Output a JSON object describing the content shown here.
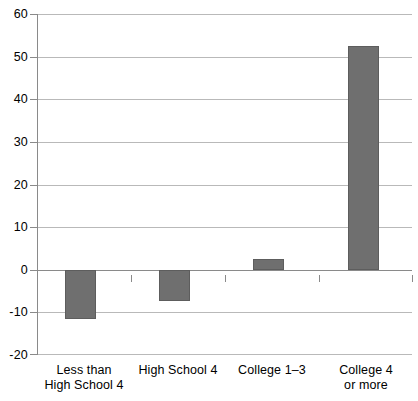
{
  "chart_data": {
    "type": "bar",
    "title": "",
    "subtitle": "",
    "xlabel": "",
    "ylabel": "",
    "categories": [
      "Less than High School 4",
      "High School 4",
      "College 1–3",
      "College 4 or more"
    ],
    "category_lines": [
      [
        "Less than",
        "High School 4"
      ],
      [
        "High School 4",
        ""
      ],
      [
        "College 1–3",
        ""
      ],
      [
        "College 4",
        "or more"
      ]
    ],
    "values": [
      -11.6,
      -7.3,
      2.6,
      52.5
    ],
    "ylim": [
      -20,
      60
    ],
    "ytick_values": [
      -20,
      -10,
      0,
      10,
      20,
      30,
      40,
      50,
      60
    ],
    "ytick_labels": [
      "-20",
      "-10",
      "0",
      "10",
      "20",
      "30",
      "40",
      "50",
      "60"
    ],
    "grid": true,
    "grid_axis": "y",
    "legend": false,
    "legend_position": "none",
    "series": [
      {
        "name": "",
        "values": [
          -11.6,
          -7.3,
          2.6,
          52.5
        ]
      }
    ]
  },
  "style": {
    "bar_color": "#6f6f6f",
    "bar_border_color": "#5d5d5d",
    "grid_color": "#b9b9b9",
    "axis_color": "#8a8a8a",
    "background": "#ffffff",
    "text_color": "#000000"
  },
  "caption": {
    "clipped_text": ""
  }
}
